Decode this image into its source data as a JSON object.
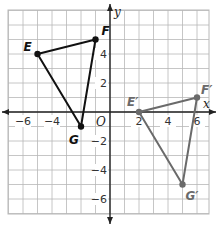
{
  "diagram": {
    "type": "coordinate-plane-transformation",
    "axes": {
      "x_label": "x",
      "y_label": "y",
      "origin_label": "O",
      "x_range": [
        -7,
        7
      ],
      "y_range": [
        -7,
        7
      ],
      "x_tick_labels": [
        {
          "value": -6,
          "text": "−6"
        },
        {
          "value": -4,
          "text": "−4"
        },
        {
          "value": 2,
          "text": "2"
        },
        {
          "value": 4,
          "text": "4"
        },
        {
          "value": 6,
          "text": "6"
        }
      ],
      "y_tick_labels": [
        {
          "value": 4,
          "text": "4"
        },
        {
          "value": 2,
          "text": "2"
        },
        {
          "value": -2,
          "text": "−2"
        },
        {
          "value": -4,
          "text": "−4"
        },
        {
          "value": -6,
          "text": "−6"
        }
      ]
    },
    "grid": {
      "on": true,
      "step": 1,
      "color": "#b8b8b8"
    },
    "triangles": [
      {
        "name": "EFG",
        "color": "#111111",
        "vertices": [
          {
            "label": "E",
            "x": -5,
            "y": 4,
            "label_dx": -14,
            "label_dy": -3
          },
          {
            "label": "F",
            "x": -1,
            "y": 5,
            "label_dx": 6,
            "label_dy": -5
          },
          {
            "label": "G",
            "x": -2,
            "y": -1,
            "label_dx": -12,
            "label_dy": 17
          }
        ]
      },
      {
        "name": "E'F'G'",
        "color": "#6a6a6a",
        "vertices": [
          {
            "label": "E′",
            "x": 2,
            "y": 0,
            "label_dx": -12,
            "label_dy": -6
          },
          {
            "label": "F′",
            "x": 6,
            "y": 1,
            "label_dx": 4,
            "label_dy": -4
          },
          {
            "label": "G′",
            "x": 5,
            "y": -5,
            "label_dx": 3,
            "label_dy": 15
          }
        ]
      }
    ]
  }
}
